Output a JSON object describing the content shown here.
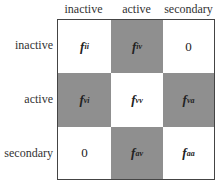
{
  "columns": [
    "inactive",
    "active",
    "secondary"
  ],
  "rows": [
    "inactive",
    "active",
    "secondary"
  ],
  "cells": [
    [
      {
        "base": "f",
        "sub": "ii",
        "shaded": false
      },
      {
        "base": "f",
        "sub": "iv",
        "shaded": true
      },
      {
        "base": "0",
        "sub": "",
        "shaded": false
      }
    ],
    [
      {
        "base": "f",
        "sub": "vi",
        "shaded": true
      },
      {
        "base": "f",
        "sub": "vv",
        "shaded": false
      },
      {
        "base": "f",
        "sub": "va",
        "shaded": true
      }
    ],
    [
      {
        "base": "0",
        "sub": "",
        "shaded": false
      },
      {
        "base": "f",
        "sub": "av",
        "shaded": true
      },
      {
        "base": "f",
        "sub": "aa",
        "shaded": false
      }
    ]
  ],
  "colors": {
    "shaded": "#8f8f8f",
    "white": "#ffffff",
    "border": "#444444"
  }
}
